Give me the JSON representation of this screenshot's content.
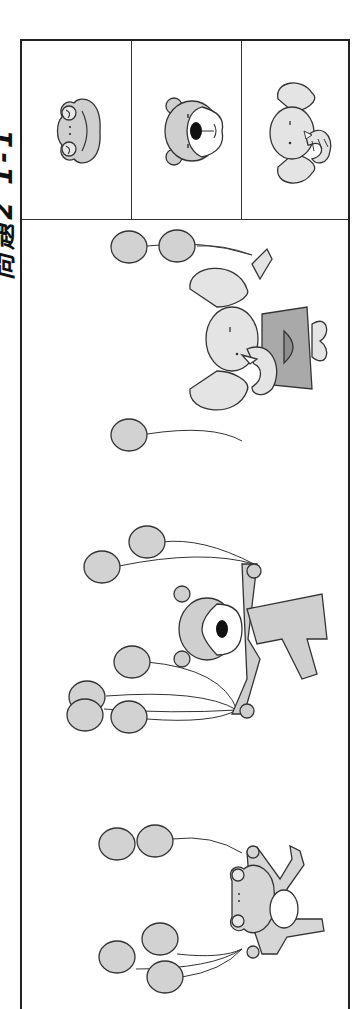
{
  "header": {
    "title": "問題2 1-1"
  },
  "choices": [
    {
      "id": "frog",
      "label": "frog-face"
    },
    {
      "id": "bear",
      "label": "bear-face"
    },
    {
      "id": "elephant",
      "label": "elephant-face"
    }
  ],
  "scene": {
    "characters": [
      {
        "animal": "elephant",
        "balloons": 3
      },
      {
        "animal": "bear",
        "balloons": 6
      },
      {
        "animal": "frog",
        "balloons": 5
      }
    ]
  },
  "colors": {
    "balloon": "#d2d2d2",
    "animal_light": "#e4e4e4",
    "animal_mid": "#cfcfcf",
    "clothing": "#a9a9a9",
    "outline": "#333333"
  }
}
